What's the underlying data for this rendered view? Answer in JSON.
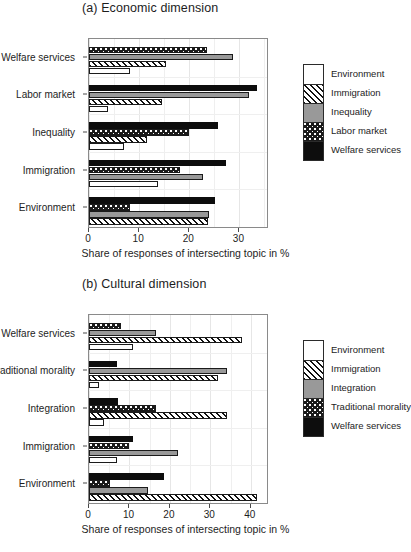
{
  "figure": {
    "panels": [
      {
        "title": "(a) Economic dimension",
        "xlabel": "Share of responses of intersecting topic in %",
        "xticks": [
          "0",
          "10",
          "20",
          "30"
        ],
        "categories": [
          "Environment",
          "Immigration",
          "Inequality",
          "Labor market",
          "Welfare services"
        ],
        "legend": [
          {
            "label": "Environment",
            "pattern": "f-white"
          },
          {
            "label": "Immigration",
            "pattern": "f-hatch"
          },
          {
            "label": "Inequality",
            "pattern": "f-gray"
          },
          {
            "label": "Labor market",
            "pattern": "f-dot"
          },
          {
            "label": "Welfare services",
            "pattern": "f-black"
          }
        ]
      },
      {
        "title": "(b) Cultural dimension",
        "xlabel": "Share of responses of intersecting topic in %",
        "xticks": [
          "0",
          "10",
          "20",
          "30",
          "40"
        ],
        "categories": [
          "Environment",
          "Immigration",
          "Integration",
          "Traditional morality",
          "Welfare services"
        ],
        "legend": [
          {
            "label": "Environment",
            "pattern": "f-white"
          },
          {
            "label": "Immigration",
            "pattern": "f-hatch"
          },
          {
            "label": "Integration",
            "pattern": "f-gray"
          },
          {
            "label": "Traditional morality",
            "pattern": "f-dot"
          },
          {
            "label": "Welfare services",
            "pattern": "f-black"
          }
        ]
      }
    ]
  },
  "chart_data": [
    {
      "type": "bar",
      "orientation": "horizontal",
      "title": "(a) Economic dimension",
      "xlabel": "Share of responses of intersecting topic in %",
      "ylabel": "",
      "xlim": [
        0,
        35.5
      ],
      "xticks": [
        0,
        10,
        20,
        30
      ],
      "grid": true,
      "legend_position": "right",
      "categories": [
        "Environment",
        "Immigration",
        "Inequality",
        "Labor market",
        "Welfare services"
      ],
      "series": [
        {
          "name": "Environment",
          "pattern": "white",
          "values": [
            null,
            13.7,
            7.0,
            3.7,
            8.1
          ]
        },
        {
          "name": "Immigration",
          "pattern": "hatch",
          "values": [
            23.7,
            null,
            11.5,
            14.5,
            15.3
          ]
        },
        {
          "name": "Inequality",
          "pattern": "gray",
          "values": [
            24.0,
            22.8,
            null,
            32.0,
            28.8
          ]
        },
        {
          "name": "Labor market",
          "pattern": "dotted",
          "values": [
            8.2,
            18.2,
            20.0,
            null,
            23.6
          ]
        },
        {
          "name": "Welfare services",
          "pattern": "black",
          "values": [
            25.2,
            27.3,
            25.8,
            33.5,
            null
          ]
        }
      ]
    },
    {
      "type": "bar",
      "orientation": "horizontal",
      "title": "(b) Cultural dimension",
      "xlabel": "Share of responses of intersecting topic in %",
      "ylabel": "",
      "xlim": [
        0,
        44
      ],
      "xticks": [
        0,
        10,
        20,
        30,
        40
      ],
      "grid": true,
      "legend_position": "right",
      "categories": [
        "Environment",
        "Immigration",
        "Integration",
        "Traditional morality",
        "Welfare services"
      ],
      "series": [
        {
          "name": "Environment",
          "pattern": "white",
          "values": [
            null,
            6.9,
            3.6,
            2.5,
            10.8
          ]
        },
        {
          "name": "Immigration",
          "pattern": "hatch",
          "values": [
            41.6,
            null,
            34.1,
            32.0,
            37.9
          ]
        },
        {
          "name": "Integration",
          "pattern": "gray",
          "values": [
            14.6,
            22.0,
            null,
            34.0,
            16.6
          ]
        },
        {
          "name": "Traditional morality",
          "pattern": "dotted",
          "values": [
            5.1,
            10.0,
            16.5,
            null,
            7.8
          ]
        },
        {
          "name": "Welfare services",
          "pattern": "black",
          "values": [
            18.5,
            10.8,
            7.2,
            7.0,
            null
          ]
        }
      ]
    }
  ]
}
